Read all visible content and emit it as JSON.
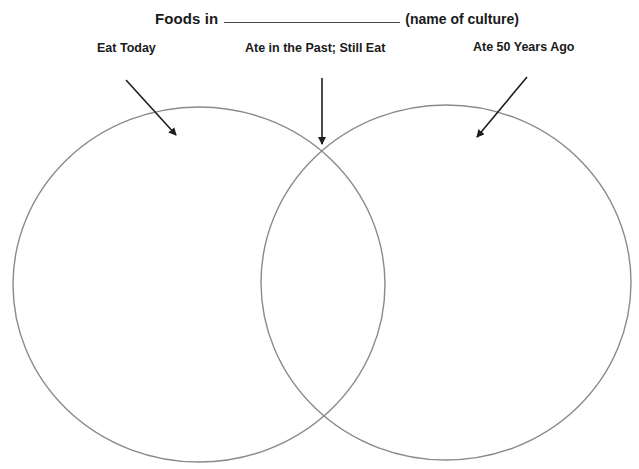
{
  "title": {
    "prefix": "Foods in",
    "blank": "",
    "suffix": "(name of culture)"
  },
  "labels": {
    "left": "Eat Today",
    "middle": "Ate in the Past; Still Eat",
    "right": "Ate 50 Years Ago"
  },
  "diagram": {
    "type": "venn",
    "sets": [
      "Eat Today",
      "Ate 50 Years Ago"
    ],
    "overlap": "Ate in the Past; Still Eat",
    "circle_color": "#8a8a8a",
    "arrow_color": "#1e1e1e"
  }
}
